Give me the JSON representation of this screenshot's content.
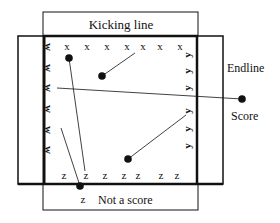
{
  "diagram": {
    "labels": {
      "kicking_line": "Kicking line",
      "endline": "Endline",
      "score": "Score",
      "not_a_score": "Not a score"
    },
    "players": {
      "x_row": [
        "x",
        "x",
        "x",
        "x",
        "x",
        "x",
        "x"
      ],
      "z_row": [
        "z",
        "z",
        "z",
        "z",
        "z",
        "z",
        "z"
      ],
      "z_outside": "z",
      "w_col": [
        "w",
        "w",
        "w",
        "w",
        "w",
        "w"
      ],
      "y_col": [
        "y",
        "y",
        "y",
        "y",
        "y",
        "y"
      ]
    },
    "colors": {
      "line": "#111111",
      "background": "#ffffff"
    }
  }
}
